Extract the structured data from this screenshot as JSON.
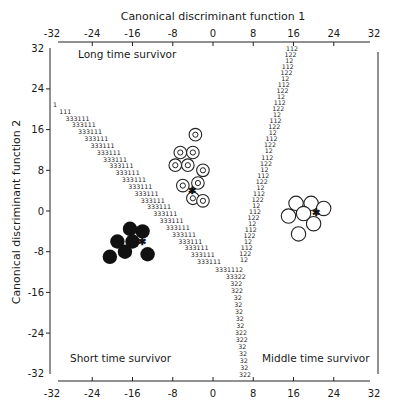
{
  "chart_data": {
    "type": "scatter",
    "subtype": "territorial-map",
    "title": "",
    "xlabel": "Canonical discriminant function 1",
    "ylabel": "Canonical discriminant function 2",
    "xlim": [
      -32,
      32
    ],
    "ylim": [
      -32,
      32
    ],
    "x_ticks": [
      -32,
      -24,
      -16,
      -8,
      0,
      8,
      16,
      24,
      32
    ],
    "y_ticks": [
      32,
      24,
      16,
      8,
      0,
      -8,
      -16,
      -24,
      -32
    ],
    "x_tick_labels": [
      "-32",
      "-24",
      "-16",
      "-8",
      "0",
      "8",
      "16",
      "24",
      "32"
    ],
    "y_tick_labels": [
      "32",
      "24",
      "16",
      "8",
      "0",
      "-8",
      "-16",
      "-24",
      "-32"
    ],
    "grid": false,
    "regions": [
      {
        "label": "Long time survivor",
        "code": "1"
      },
      {
        "label": "Short time survivor",
        "code": "3"
      },
      {
        "label": "Middle time survivor",
        "code": "2"
      }
    ],
    "series": [
      {
        "name": "Short time survivor",
        "marker": "filled-circle",
        "points": [
          [
            -16.5,
            -3.5
          ],
          [
            -14,
            -4
          ],
          [
            -19,
            -6
          ],
          [
            -16,
            -6
          ],
          [
            -20.5,
            -9
          ],
          [
            -17.5,
            -8
          ],
          [
            -13,
            -8.5
          ]
        ],
        "centroid": [
          -14.2,
          -6
        ]
      },
      {
        "name": "Long time survivor",
        "marker": "ring-circle",
        "points": [
          [
            -3.5,
            15
          ],
          [
            -6.5,
            11.5
          ],
          [
            -4,
            11.5
          ],
          [
            -7.5,
            9
          ],
          [
            -5,
            9
          ],
          [
            -2,
            8
          ],
          [
            -6,
            5
          ],
          [
            -3,
            5.5
          ],
          [
            -4,
            2.5
          ],
          [
            -2,
            2
          ]
        ],
        "centroid": [
          -4.2,
          4
        ]
      },
      {
        "name": "Middle time survivor",
        "marker": "open-circle",
        "points": [
          [
            16.5,
            1.5
          ],
          [
            19.5,
            1.5
          ],
          [
            22,
            0.5
          ],
          [
            15,
            -1
          ],
          [
            18,
            -0.5
          ],
          [
            20,
            -2.5
          ],
          [
            17,
            -4.5
          ]
        ],
        "centroid": [
          20.5,
          -0.2
        ]
      }
    ],
    "boundaries": {
      "boundary_1_3": "diagonal from (-32,17) to (6,-12)",
      "boundary_1_2": "from (17,31) to (6,-12)",
      "boundary_2_3": "vertical near x=6 from (6,-12) down to -32"
    }
  },
  "territorial_rows": {
    "diag": [
      "1",
      "111",
      "333111",
      "333111",
      "333111",
      "333111",
      "333111",
      "333111",
      "333111",
      "333111",
      "333111",
      "333111",
      "333111",
      "333111",
      "333111",
      "333111",
      "333111",
      "333111",
      "333111",
      "333111",
      "333111",
      "333111",
      "333111",
      "333111"
    ],
    "right": [
      "112",
      "122",
      "12",
      "112",
      "122",
      "12",
      "112",
      "122",
      "12",
      "112",
      "122",
      "12",
      "112",
      "122",
      "12",
      "112",
      "122",
      "12",
      "112",
      "122",
      "12",
      "112",
      "122",
      "12",
      "112",
      "122",
      "12",
      "112",
      "122",
      "12",
      "112",
      "122",
      "12",
      "112",
      "122",
      "12"
    ],
    "bottom": [
      "3331112",
      "33322",
      "322",
      "322",
      "32",
      "32",
      "32",
      "32",
      "32",
      "322",
      "322",
      "32",
      "32",
      "32",
      "32",
      "322"
    ]
  }
}
